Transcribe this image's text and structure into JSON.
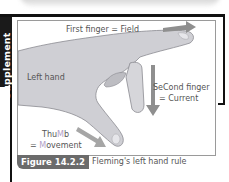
{
  "section_tab": {
    "label": "Supplement"
  },
  "figure": {
    "labels": {
      "first_finger": "First finger = Field",
      "left_hand": "Left hand",
      "second_finger_line1_pre": "Se",
      "second_finger_line1_hl": "C",
      "second_finger_line1_post": "ond finger",
      "second_finger_line2": "= Current",
      "thumb_line1_pre": "Thu",
      "thumb_line1_hl": "M",
      "thumb_line1_post": "b",
      "thumb_line2_pre": "= ",
      "thumb_line2_hl": "M",
      "thumb_line2_post": "ovement"
    },
    "arrows": [
      {
        "name": "field",
        "direction": "right"
      },
      {
        "name": "current",
        "direction": "down"
      },
      {
        "name": "movement",
        "direction": "down-right"
      }
    ],
    "colors": {
      "hand_fill": "#cfcfd4",
      "hand_outline": "#8a8a90",
      "arrow": "#8f8f8f",
      "highlight_letter": "#b0a0c8"
    }
  },
  "caption": {
    "number": "Figure 14.2.2",
    "title": "Fleming's left hand rule"
  }
}
